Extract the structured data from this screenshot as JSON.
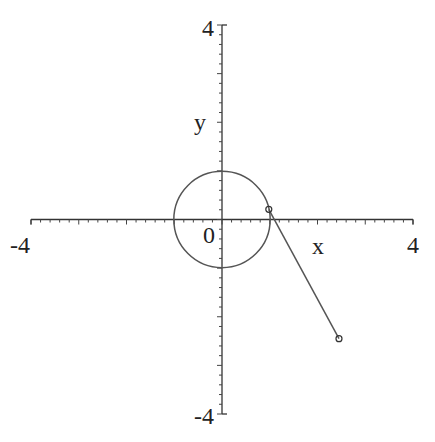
{
  "chart_data": {
    "type": "line",
    "title": "",
    "xlabel": "x",
    "ylabel": "y",
    "xlim": [
      -4,
      4
    ],
    "ylim": [
      -4,
      4
    ],
    "grid": false,
    "axes_style": "normal (through origin)",
    "tick_labels": {
      "x": [
        "-4",
        "4"
      ],
      "y": [
        "-4",
        "4"
      ],
      "origin": "0"
    },
    "minor_tick_step": 0.2,
    "series": [
      {
        "name": "circle",
        "kind": "curve",
        "description": "unit circle x^2 + y^2 = 1",
        "center": [
          0,
          0
        ],
        "radius": 1
      },
      {
        "name": "segment",
        "kind": "line segment",
        "points": [
          [
            0.98,
            0.21
          ],
          [
            2.45,
            -2.45
          ]
        ],
        "markers": "small open circles at both endpoints"
      }
    ],
    "colors": {
      "axes": "#333333",
      "curves": "#555555",
      "background": "#ffffff"
    }
  },
  "labels": {
    "x_axis_label": "x",
    "y_axis_label": "y",
    "x_min_label": "-4",
    "x_max_label": "4",
    "y_min_label": "-4",
    "y_max_label": "4",
    "origin_label": "0"
  }
}
